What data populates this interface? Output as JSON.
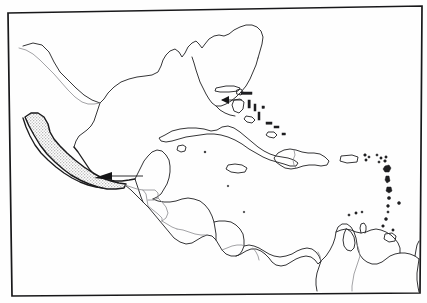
{
  "figure": {
    "projection_note": "equirectangular outline, frame slightly rotated",
    "width_px": 427,
    "height_px": 303
  },
  "style": {
    "background_color": "#fefefe",
    "frame_color": "#18181a",
    "coastline_color": "#2a2a2c",
    "internal_border_color": "#8b8b8f",
    "range_fill_color": "#d9d9d9",
    "range_outline_color": "#1a1a1c",
    "island_fill_color": "#1e1e20",
    "pointer_color": "#141416"
  },
  "legend": {
    "range_label": "",
    "pointer_label": "",
    "has_visible_text": false,
    "caption": ""
  },
  "map_features": {
    "landmasses": [
      {
        "name": "north-america-gulf-coast",
        "label": "",
        "stroke": "coastline"
      },
      {
        "name": "florida-peninsula",
        "label": "",
        "stroke": "coastline"
      },
      {
        "name": "mexico-mainland",
        "label": "",
        "stroke": "coastline"
      },
      {
        "name": "yucatan-peninsula",
        "label": "",
        "stroke": "coastline"
      },
      {
        "name": "central-america-isthmus",
        "label": "",
        "stroke": "coastline"
      },
      {
        "name": "south-america-north-coast",
        "label": "",
        "stroke": "coastline"
      }
    ],
    "islands": [
      {
        "name": "cuba",
        "label": "",
        "style": "outline"
      },
      {
        "name": "isla-de-la-juventud",
        "label": "",
        "style": "outline"
      },
      {
        "name": "jamaica",
        "label": "",
        "style": "outline"
      },
      {
        "name": "hispaniola",
        "label": "",
        "style": "outline"
      },
      {
        "name": "puerto-rico",
        "label": "",
        "style": "outline"
      },
      {
        "name": "bahamas-archipelago",
        "label": "",
        "style": "mixed"
      },
      {
        "name": "lesser-antilles-arc",
        "label": "",
        "style": "solid"
      },
      {
        "name": "trinidad",
        "label": "",
        "style": "outline"
      }
    ],
    "internal_borders": [
      {
        "name": "usa-mexico-border",
        "label": ""
      },
      {
        "name": "mexico-guatemala-border",
        "label": ""
      },
      {
        "name": "mexico-belize-border",
        "label": ""
      },
      {
        "name": "guatemala-honduras-border",
        "label": ""
      },
      {
        "name": "guatemala-el-salvador-border",
        "label": ""
      },
      {
        "name": "honduras-nicaragua-border",
        "label": ""
      },
      {
        "name": "nicaragua-costa-rica-border",
        "label": ""
      },
      {
        "name": "costa-rica-panama-border",
        "label": ""
      },
      {
        "name": "haiti-dominican-republic-border",
        "label": ""
      },
      {
        "name": "colombia-venezuela-border",
        "label": ""
      }
    ],
    "shaded_range": {
      "name": "pacific-coast-range-polygon",
      "label": "",
      "description": "stippled band from Sinaloa/Nayarit southeast along the Pacific slope to the Guatemala border",
      "fill": "#d9d9d9"
    },
    "pointers": [
      {
        "name": "pointer-arrow-florida",
        "label": "",
        "direction": "left",
        "target": "south-florida"
      },
      {
        "name": "pointer-arrow-isthmus",
        "label": "",
        "direction": "left",
        "target": "pacific-coast-range"
      }
    ]
  }
}
